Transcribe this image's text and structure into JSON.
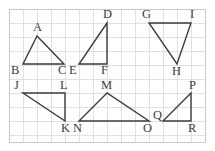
{
  "figure": {
    "background_color": "#ffffff",
    "stroke_color": "#3b3b3f",
    "grid_color": "#d9d9dd",
    "frame_color": "#c9c9cf",
    "label_color": "#3b3b3f",
    "width": 215,
    "height": 151
  },
  "grid": {
    "origin_x": 9,
    "origin_y": 9,
    "cell": 14,
    "cols": 14,
    "rows": 9.5,
    "x_lines": [
      9,
      23,
      37,
      51,
      65,
      79,
      93,
      107,
      121,
      135,
      149,
      163,
      177,
      191,
      205
    ],
    "y_lines": [
      9,
      23,
      37,
      51,
      65,
      79,
      93,
      107,
      121,
      135,
      142
    ],
    "frame": {
      "x": 9,
      "y": 9,
      "width": 196,
      "height": 133
    }
  },
  "triangles": [
    {
      "name": "triangle-abc",
      "labels": [
        "A",
        "B",
        "C"
      ],
      "points": "37,36 23,64 64,64",
      "vertices": [
        {
          "label": "A",
          "x": 37,
          "y": 36,
          "label_x": 33,
          "label_y": 31
        },
        {
          "label": "B",
          "x": 23,
          "y": 64,
          "label_x": 11,
          "label_y": 74
        },
        {
          "label": "C",
          "x": 64,
          "y": 64,
          "label_x": 58,
          "label_y": 74
        }
      ]
    },
    {
      "name": "triangle-def",
      "labels": [
        "D",
        "E",
        "F"
      ],
      "points": "107,23 79,64 107,64",
      "vertices": [
        {
          "label": "D",
          "x": 107,
          "y": 23,
          "label_x": 103,
          "label_y": 18
        },
        {
          "label": "E",
          "x": 79,
          "y": 64,
          "label_x": 69,
          "label_y": 74
        },
        {
          "label": "F",
          "x": 107,
          "y": 64,
          "label_x": 101,
          "label_y": 74
        }
      ]
    },
    {
      "name": "triangle-ghi",
      "labels": [
        "G",
        "H",
        "I"
      ],
      "points": "149,23 191,23 177,64",
      "vertices": [
        {
          "label": "G",
          "x": 149,
          "y": 23,
          "label_x": 142,
          "label_y": 18
        },
        {
          "label": "I",
          "x": 191,
          "y": 23,
          "label_x": 190,
          "label_y": 18
        },
        {
          "label": "H",
          "x": 177,
          "y": 64,
          "label_x": 172,
          "label_y": 75
        }
      ]
    },
    {
      "name": "triangle-jkl",
      "labels": [
        "J",
        "K",
        "L"
      ],
      "points": "23,93 65,93 65,121",
      "vertices": [
        {
          "label": "J",
          "x": 23,
          "y": 93,
          "label_x": 14,
          "label_y": 89
        },
        {
          "label": "L",
          "x": 65,
          "y": 93,
          "label_x": 60,
          "label_y": 89
        },
        {
          "label": "K",
          "x": 65,
          "y": 121,
          "label_x": 61,
          "label_y": 132
        }
      ]
    },
    {
      "name": "triangle-mno",
      "labels": [
        "M",
        "N",
        "O"
      ],
      "points": "107,93 79,121 149,121",
      "vertices": [
        {
          "label": "M",
          "x": 107,
          "y": 93,
          "label_x": 101,
          "label_y": 89
        },
        {
          "label": "N",
          "x": 79,
          "y": 121,
          "label_x": 73,
          "label_y": 132
        },
        {
          "label": "O",
          "x": 149,
          "y": 121,
          "label_x": 143,
          "label_y": 132
        }
      ]
    },
    {
      "name": "triangle-pqr",
      "labels": [
        "P",
        "Q",
        "R"
      ],
      "points": "191,93 163,121 191,121",
      "vertices": [
        {
          "label": "P",
          "x": 191,
          "y": 93,
          "label_x": 189,
          "label_y": 89
        },
        {
          "label": "Q",
          "x": 163,
          "y": 121,
          "label_x": 153,
          "label_y": 119
        },
        {
          "label": "R",
          "x": 191,
          "y": 121,
          "label_x": 188,
          "label_y": 132
        }
      ]
    }
  ]
}
